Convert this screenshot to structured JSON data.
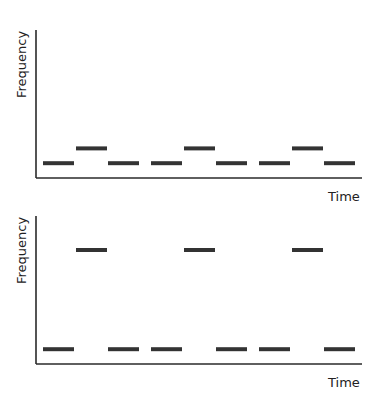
{
  "chart_data": [
    {
      "type": "line",
      "title": "",
      "xlabel": "Time",
      "ylabel": "Frequency",
      "segments": [
        {
          "slot": 0,
          "level": "low"
        },
        {
          "slot": 1,
          "level": "high"
        },
        {
          "slot": 2,
          "level": "low"
        },
        {
          "slot": 3,
          "level": "low"
        },
        {
          "slot": 4,
          "level": "high"
        },
        {
          "slot": 5,
          "level": "low"
        },
        {
          "slot": 6,
          "level": "low"
        },
        {
          "slot": 7,
          "level": "high"
        },
        {
          "slot": 8,
          "level": "low"
        }
      ],
      "levels": {
        "low": 0.1,
        "high": 0.2
      },
      "ylim": [
        0,
        1
      ]
    },
    {
      "type": "line",
      "title": "",
      "xlabel": "Time",
      "ylabel": "Frequency",
      "segments": [
        {
          "slot": 0,
          "level": "low"
        },
        {
          "slot": 1,
          "level": "high"
        },
        {
          "slot": 2,
          "level": "low"
        },
        {
          "slot": 3,
          "level": "low"
        },
        {
          "slot": 4,
          "level": "high"
        },
        {
          "slot": 5,
          "level": "low"
        },
        {
          "slot": 6,
          "level": "low"
        },
        {
          "slot": 7,
          "level": "high"
        },
        {
          "slot": 8,
          "level": "low"
        }
      ],
      "levels": {
        "low": 0.1,
        "high": 0.77
      },
      "ylim": [
        0,
        1
      ]
    }
  ]
}
